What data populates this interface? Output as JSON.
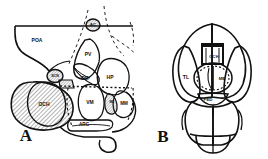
{
  "figure": {
    "type": "anatomical-diagram",
    "background_color": "#ffffff",
    "line_color": "#111111",
    "hatch_color": "#555555"
  },
  "panels": [
    {
      "id": "A",
      "letter": "A",
      "letter_x": 26,
      "letter_y": 137,
      "view": "sagittal",
      "labels": [
        {
          "text": "AC",
          "x": 93,
          "y": 24,
          "size": 4.4
        },
        {
          "text": "POA",
          "x": 37,
          "y": 41,
          "size": 5.0
        },
        {
          "text": "PV",
          "x": 88,
          "y": 55,
          "size": 5.0
        },
        {
          "text": "SCN",
          "x": 55,
          "y": 76,
          "size": 3.6
        },
        {
          "text": "DM",
          "x": 85,
          "y": 79,
          "size": 4.6
        },
        {
          "text": "HP",
          "x": 110,
          "y": 78,
          "size": 5.0
        },
        {
          "text": "OCH",
          "x": 44,
          "y": 105,
          "size": 5.0
        },
        {
          "text": "VM",
          "x": 90,
          "y": 103,
          "size": 5.0
        },
        {
          "text": "ML",
          "x": 112,
          "y": 102,
          "size": 3.4
        },
        {
          "text": "MM",
          "x": 124,
          "y": 104,
          "size": 4.6
        },
        {
          "text": "ARC",
          "x": 84,
          "y": 125,
          "size": 4.6
        }
      ]
    },
    {
      "id": "B",
      "letter": "B",
      "letter_x": 163,
      "letter_y": 138,
      "view": "dorsal",
      "labels": [
        {
          "text": "TL",
          "x": 186,
          "y": 78,
          "size": 5.2
        },
        {
          "text": "OCH",
          "x": 214,
          "y": 58,
          "size": 4.2
        },
        {
          "text": "ME",
          "x": 222,
          "y": 79,
          "size": 4.4
        },
        {
          "text": "PED",
          "x": 208,
          "y": 101,
          "size": 4.4
        }
      ]
    }
  ]
}
